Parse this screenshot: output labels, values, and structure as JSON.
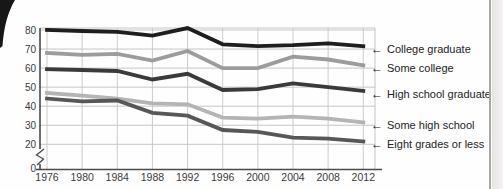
{
  "chart_data": {
    "type": "line",
    "title": "",
    "xlabel": "",
    "ylabel": "",
    "x": [
      1976,
      1980,
      1984,
      1988,
      1992,
      1996,
      2000,
      2004,
      2008,
      2012
    ],
    "series": [
      {
        "name": "College graduate",
        "color": "#1e1e1e",
        "values": [
          80,
          79.5,
          79,
          77,
          81,
          72.5,
          71.5,
          72,
          73,
          71.5
        ]
      },
      {
        "name": "Some college",
        "color": "#9c9c9c",
        "values": [
          68,
          67,
          67.5,
          64,
          69,
          60,
          60,
          66,
          64.5,
          61.5
        ]
      },
      {
        "name": "High school graduate",
        "color": "#3a3a3a",
        "values": [
          59.5,
          59,
          58.5,
          54,
          57,
          48.5,
          49,
          52,
          50,
          48
        ]
      },
      {
        "name": "Some high school",
        "color": "#b4b4b4",
        "values": [
          47,
          45.5,
          44,
          41.5,
          41,
          34,
          33.5,
          34.5,
          33.5,
          31.5
        ]
      },
      {
        "name": "Eight grades or less",
        "color": "#575757",
        "values": [
          44,
          42.5,
          43,
          36.5,
          35,
          27.5,
          26.5,
          23.5,
          23,
          21.5
        ]
      }
    ],
    "yticks": [
      20,
      30,
      40,
      50,
      60,
      70,
      80
    ],
    "origin_label": "0",
    "axis_break": true,
    "grid": true,
    "legend_position": "right",
    "legend_arrow": "←",
    "colors": {
      "grid": "#c6c6c6",
      "axis": "#4a4a4a",
      "tick_text": "#3a3a3a"
    }
  }
}
